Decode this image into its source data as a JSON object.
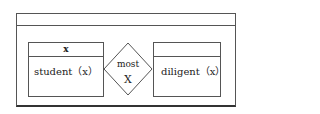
{
  "diagram": {
    "outer_box": {
      "header_label": ""
    },
    "left_box": {
      "header": "x",
      "body": "student（x）"
    },
    "connector": {
      "line1": "most",
      "line2": "X"
    },
    "right_box": {
      "header": "",
      "body": "diligent（x）"
    },
    "colors": {
      "stroke": "#555555",
      "background": "#ffffff",
      "text": "#222222"
    }
  }
}
